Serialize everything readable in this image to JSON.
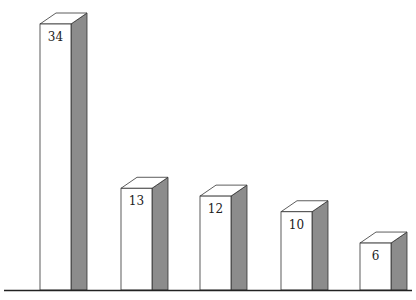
{
  "chart_data": {
    "type": "bar",
    "style": "3d",
    "title": "",
    "xlabel": "",
    "ylabel": "",
    "categories": [
      "",
      "",
      "",
      "",
      ""
    ],
    "values": [
      34,
      13,
      12,
      10,
      6
    ],
    "data_labels": [
      "34",
      "13",
      "12",
      "10",
      "6"
    ],
    "grid": false,
    "legend": null
  },
  "colors": {
    "front": "#ffffff",
    "side": "#8c8c8c",
    "top": "#ffffff",
    "outline": "#333333",
    "axis": "#222222"
  }
}
